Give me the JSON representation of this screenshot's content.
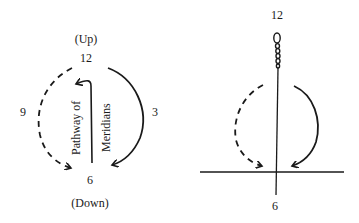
{
  "left_diagram": {
    "top_label": "(Up)",
    "bottom_label": "(Down)",
    "clock": {
      "twelve": "12",
      "three": "3",
      "six": "6",
      "nine": "9"
    },
    "vertical_text_left": "Pathway of",
    "vertical_text_right": "Meridians"
  },
  "right_diagram": {
    "clock": {
      "twelve": "12",
      "six": "6"
    }
  },
  "colors": {
    "ink": "#1a1a1a",
    "background": "#ffffff"
  }
}
